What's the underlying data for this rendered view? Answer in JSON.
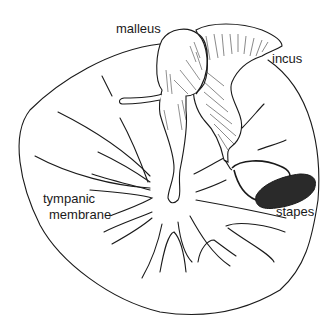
{
  "diagram": {
    "colors": {
      "ink": "#1a1a1a",
      "background": "#ffffff",
      "dark_fill": "#2a2a2a"
    },
    "labels": {
      "malleus": "malleus",
      "incus": "incus",
      "stapes": "stapes",
      "tympanic_line1": "tympanic",
      "tympanic_line2": "membrane"
    }
  }
}
